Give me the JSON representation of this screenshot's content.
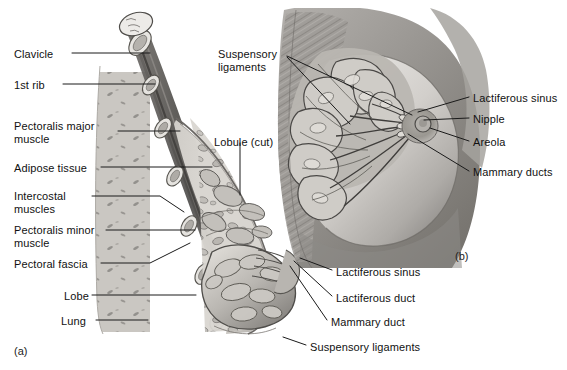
{
  "figure": {
    "width": 567,
    "height": 370,
    "background_color": "#ffffff",
    "text_color": "#111111",
    "leader_line_color": "#1a1a1a"
  },
  "panels": [
    {
      "tag": "(a)",
      "name": "sagittal-section",
      "x": 14,
      "y": 345
    },
    {
      "tag": "(b)",
      "name": "anterior-view",
      "x": 455,
      "y": 250
    }
  ],
  "labels": {
    "panel_a_left": [
      {
        "text": "Clavicle",
        "x": 14,
        "y": 48,
        "align": "left",
        "lines": 1
      },
      {
        "text": "1st rib",
        "x": 14,
        "y": 79,
        "align": "left",
        "lines": 1
      },
      {
        "text": "Pectoralis major\nmuscle",
        "x": 14,
        "y": 120,
        "align": "left",
        "lines": 2
      },
      {
        "text": "Adipose tissue",
        "x": 14,
        "y": 162,
        "align": "left",
        "lines": 1
      },
      {
        "text": "Intercostal\nmuscles",
        "x": 14,
        "y": 190,
        "align": "left",
        "lines": 2
      },
      {
        "text": "Pectoralis minor\nmuscle",
        "x": 14,
        "y": 224,
        "align": "left",
        "lines": 2
      },
      {
        "text": "Pectoral fascia",
        "x": 14,
        "y": 258,
        "align": "left",
        "lines": 1
      },
      {
        "text": "Lobe",
        "x": 64,
        "y": 290,
        "align": "left",
        "lines": 1
      },
      {
        "text": "Lung",
        "x": 61,
        "y": 315,
        "align": "left",
        "lines": 1
      }
    ],
    "panel_a_center": [
      {
        "text": "Lobule (cut)",
        "x": 214,
        "y": 136,
        "align": "left",
        "lines": 1
      }
    ],
    "panel_a_bottom": [
      {
        "text": "Lactiferous sinus",
        "x": 336,
        "y": 266,
        "align": "left",
        "lines": 1
      },
      {
        "text": "Lactiferous duct",
        "x": 336,
        "y": 292,
        "align": "left",
        "lines": 1
      },
      {
        "text": "Mammary duct",
        "x": 331,
        "y": 316,
        "align": "left",
        "lines": 1
      },
      {
        "text": "Suspensory ligaments",
        "x": 310,
        "y": 341,
        "align": "left",
        "lines": 1
      }
    ],
    "panel_b_top": [
      {
        "text": "Suspensory\nligaments",
        "x": 218,
        "y": 48,
        "align": "left",
        "lines": 2
      }
    ],
    "panel_b_right": [
      {
        "text": "Lactiferous sinus",
        "x": 473,
        "y": 92,
        "align": "left",
        "lines": 1
      },
      {
        "text": "Nipple",
        "x": 473,
        "y": 113,
        "align": "left",
        "lines": 1
      },
      {
        "text": "Areola",
        "x": 473,
        "y": 136,
        "align": "left",
        "lines": 1
      },
      {
        "text": "Mammary ducts",
        "x": 473,
        "y": 166,
        "align": "left",
        "lines": 1
      }
    ]
  },
  "leader_lines": [
    {
      "name": "leader-clavicle",
      "points": "72,53 150,53"
    },
    {
      "name": "leader-1st-rib",
      "points": "63,84 155,84"
    },
    {
      "name": "leader-pectoralis-major",
      "points": "118,131 180,131"
    },
    {
      "name": "leader-adipose-tissue",
      "points": "101,167 212,167"
    },
    {
      "name": "leader-intercostal",
      "points": "92,196 160,196 184,212"
    },
    {
      "name": "leader-pectoralis-minor",
      "points": "106,230 195,230"
    },
    {
      "name": "leader-pectoral-fascia",
      "points": "101,263 150,263 190,243"
    },
    {
      "name": "leader-lobe",
      "points": "92,295 196,295"
    },
    {
      "name": "leader-lung",
      "points": "96,320 148,320"
    },
    {
      "name": "leader-lobule-cut",
      "points": "240,143 240,195"
    },
    {
      "name": "leader-lactiferous-sinus-a",
      "points": "332,270 300,258"
    },
    {
      "name": "leader-lactiferous-duct-a",
      "points": "332,296 294,261"
    },
    {
      "name": "leader-mammary-duct-a",
      "points": "327,320 290,266"
    },
    {
      "name": "leader-suspensory-lig-a",
      "points": "306,345 283,337"
    },
    {
      "name": "leader-suspensory-lig-b-1",
      "points": "287,56 412,115"
    },
    {
      "name": "leader-suspensory-lig-b-2",
      "points": "287,57 350,124"
    },
    {
      "name": "leader-lactiferous-sinus-b",
      "points": "469,97 418,112"
    },
    {
      "name": "leader-nipple-b",
      "points": "469,118 424,120"
    },
    {
      "name": "leader-areola-b",
      "points": "469,141 430,128"
    },
    {
      "name": "leader-mammary-ducts-b",
      "points": "469,171 408,134"
    }
  ],
  "art": {
    "panel_a_name": "sagittal-breast-cross-section-illustration",
    "panel_b_name": "anterior-breast-dissection-illustration",
    "tone_light": "#d8d6d2",
    "tone_mid": "#a9a7a4",
    "tone_dark": "#6e6c6a",
    "tone_deep": "#454442"
  }
}
